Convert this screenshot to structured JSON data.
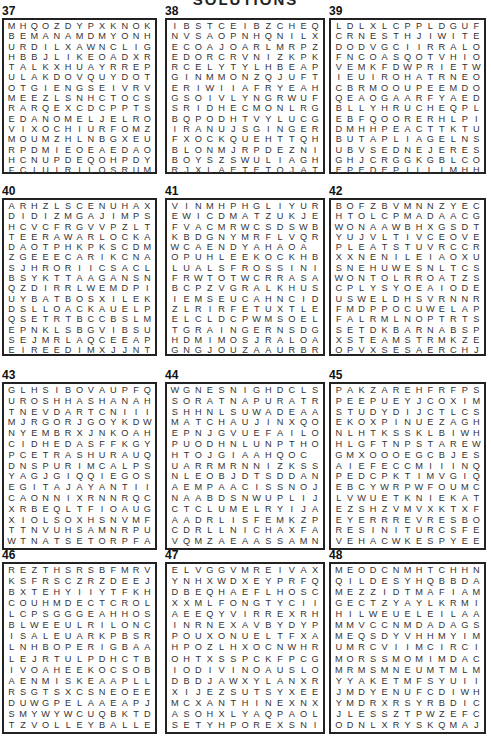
{
  "header": {
    "title": "SOLUTIONS"
  },
  "puzzles": [
    {
      "number": "37",
      "cols": 13,
      "rows": [
        "MHQOZDYPXKNOK",
        "BEMANAMDMYONH",
        "URDILXAWNCLIG",
        "HBBJLIKEOADXR",
        "TALKXHUAYRREP",
        "ULAKDOVQUYDOT",
        "OTGIENGSEIVRV",
        "MEEZLSNHCTOCS",
        "RARQEXCDCPPTS",
        "EDANOMELJELRO",
        "VIXOCHIURFOMZ",
        "MOUMZHLNBGXEU",
        "RPDMIEOEAEDAO",
        "HCNUPDEQOHPDY",
        "FCIUIRILOSRUM"
      ]
    },
    {
      "number": "38",
      "cols": 13,
      "rows": [
        "IBSTCEIBZCHEQ",
        "NVSAOPNHQNILX",
        "ECOAJOARLMRPZ",
        "EDORCRVNIZKPK",
        "RCELYTYLHBEAP",
        "GINMMONZQJUFT",
        "ERIWIIAFRYEAH",
        "GSOIVLYNGRWUF",
        "SRIDHECMONLRG",
        "BQPODHTVYLUCG",
        "IRANUJSGINGER",
        "FXOCKQUEHTTQH",
        "BLONMJRPDEZNI",
        "BOYSZSWULIAGHT",
        "RJXLAETETOJAT"
      ]
    },
    {
      "number": "39",
      "cols": 13,
      "rows": [
        "LDLXLCPPLDGUF",
        "CRNESTHJIWITE",
        "DODVGCIIRRALO",
        "FNCOASQOTVHIO",
        "VEMKFDWPRIETW",
        "IEUIROHATRNEO",
        "CBRMOOUPEEMDO",
        "QEAOGAARFYAED",
        "BLLYHRUCHEQPL",
        "EBFQOORERHLPIO",
        "DMHHPEACTTKTU",
        "BUTAPLIAGELNS",
        "UBVSEDNEJERES",
        "GHJCRGGKGBLCO",
        "EPEDEPILLIMHH"
      ]
    },
    {
      "number": "40",
      "cols": 13,
      "rows": [
        "ARHZLSCENUHAX",
        "DIDIZMGAJIMPS",
        "HCVCFRGVVPZLT",
        "TEERAWARLOCKAP",
        "DAOTPHKPKSCDM",
        "ZGEEECARIKCNA",
        "SJHRORIICSACL",
        "BSYKTTAAGANSN",
        "QZDIRRLWEMDPI",
        "UYBATBOSXILEK",
        "DSLLOACKAUELP",
        "QSETRTBCCBSLM",
        "EPNKLSBGVIBSU",
        "SEJMRLAQCEEAP",
        "EIREEDIMXJJNTT"
      ]
    },
    {
      "number": "41",
      "cols": 13,
      "rows": [
        "VINMHPHGLIYUR",
        "EWICDMATZUKJE",
        "FVACMRWCSDSWB",
        "KBDGNYMRFLVQR",
        "WCAENDYAHAOA",
        "OPUHLEEKOCKHB",
        "LUALSFROSSINI",
        "FRWTOTWCRRASA",
        "BCPZVGRALKHUS",
        "IEMSEUCAHNCID",
        "ZLRIRFETUXTLE",
        "ELCLDCPWMSOEL",
        "TGRAINGERNSDG",
        "HDMIMOSJRALOA",
        "GNGJOUZAAURBR"
      ]
    },
    {
      "number": "42",
      "cols": 13,
      "rows": [
        "BOFZBVMNNZYEC",
        "HTOLCPMADAACG",
        "WONAAWBHXGSDT",
        "YUJVLTIVCEOVE",
        "PLEATSTUVRCCR",
        "XXNENILEIAOXU",
        "SNEHUWESNLTCS",
        "WONTOLRROATZS",
        "CPLYSYOEAIODE",
        "USWELDHSVRNNR",
        "FMDPPOCUWELAP",
        "FALRMLNOPTRTS",
        "SETDKBARNABSP",
        "XSTEAMSTRMKZE",
        "OPVXSESAERCHJ"
      ]
    },
    {
      "number": "43",
      "cols": 13,
      "rows": [
        "GLHSIBOVAUPFQ",
        "UROSHHASHANAH",
        "TNEVDARTCNIII",
        "MJRGORJGOYKDW",
        "NYEMBRXJNKOAH",
        "CIDHEDASFFKGY",
        "PCETRASHURAUQ",
        "DNSPURIMCALPS",
        "YAGJGIQQIEGOS",
        "EGITAJAYANTII",
        "CAONNIXRNNRQC",
        "XRBEQLTFIOAUG",
        "XIOLSOXHSNVMF",
        "TTNVUHSAMNRPU",
        "WTNATSETORPFA"
      ]
    },
    {
      "number": "44",
      "cols": 13,
      "rows": [
        "WGNESNIGHDCLS",
        "SORATNAPURATR",
        "SHHNLSUWADEAA",
        "MATCHAUJINXQO",
        "EPNJGVUEFAILO",
        "PUODHNLUNPTHO",
        "HTOJGIAAHQOC",
        "UARRMRNNIZKSS",
        "NLEOBJDTSDDAN",
        "AEMPAACISSNOJ",
        "NAABDSNWUPLIJ",
        "CTCLUMELRYIJA",
        "AADRLISFEMKZP",
        "CDRLLNICHAXFA",
        "VQMZAEAASSAMN"
      ]
    },
    {
      "number": "45",
      "cols": 13,
      "rows": [
        "PAKZAREHFRFPS",
        "PEEPUEYJCOXIM",
        "STUDYDIJCTLCS",
        "EKOXPINUEZAGH",
        "NLHTKSSKLBIWH",
        "HLGFTNPSTAREW",
        "GMXOOOEGCBJES",
        "AIEFECCMIIINQ",
        "PEDCPKTIMVGIQ",
        "EBCYWRPWFOUMC",
        "LVWUETKNIEKAT",
        "EZSHZVMVXKTXF",
        "EYERRREVRESBOES",
        "RESINITURCSFE",
        "VEHACWKESPYEE"
      ]
    },
    {
      "number": "46",
      "cols": 13,
      "rows": [
        "REZTHSRSBFMRV",
        "KSFRSCZRZDEEJ",
        "BXTEHYIIYTFKH",
        "COUHMDECTCROL",
        "LCPSGGGEAHHOS",
        "BLWEEULRILONC",
        "ISALEUARKPBSR",
        "LNHBOPERIGBAA",
        "LEJRTULPDHCTB",
        "IVOAHEEKOCSOB",
        "AENMISKEAAPLL",
        "RSGTSXCSNEOEE",
        "DUWGPELAAEAPJ",
        "SMYWYWCUQBKTD",
        "TZVOLLEYBALLE"
      ]
    },
    {
      "number": "47",
      "cols": 13,
      "rows": [
        "ELVGGVMREIVAX",
        "YNHXWDXEYPRFQ",
        "DBEQHAEFLHOSC",
        "XXMLFONGTYCII",
        "AEEQYVIRREXRH",
        "INRNEXAVBYDYP",
        "POUXONUELTFXA",
        "HPOZLHXOCNWHR",
        "OHTXSSPCKFPCG",
        "IODIVINOAUSLO",
        "DBDJAWXYLANXR",
        "XIJEZSUTSYXEE",
        "MCXANTHINEXNX",
        "ASOHXLYAQPAOL",
        "SETYHPOREXSNI"
      ]
    },
    {
      "number": "48",
      "cols": 13,
      "rows": [
        "MEODCNMHTCHHN",
        "QILDESYHQBBDA",
        "MEZZIDTMAFIAM",
        "GECTZYAYLKRMI",
        "HILWEUELEILAA",
        "MMVCCNMDADAGS",
        "MEQSDYVHHMYIM",
        "UMRCVIIMCIRCI",
        "MORSSMOMIMDAC",
        "MRMSMNEUMTMLM",
        "YYAKETMFSYUII",
        "JMDYENUFCDIWH",
        "YMDRXRSYRBDIC",
        "JLESSZTPWZEFC",
        "ODNLXRYSKQMAJ"
      ]
    }
  ]
}
